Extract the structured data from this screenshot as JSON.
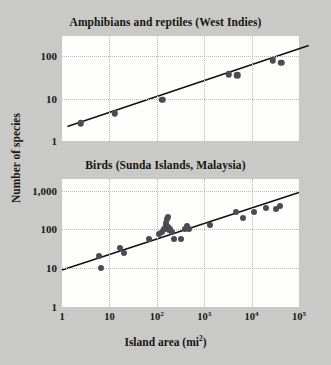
{
  "figure": {
    "background_color": "#c9c9c7",
    "plot_background_color": "#fdfdfb",
    "point_color": "#4b4b52",
    "line_color": "#121212",
    "grid_color": "#b9bcb0",
    "y_axis_label": "Number of species",
    "x_axis_label_prefix": "Island area (mi",
    "x_axis_label_sup": "2",
    "x_axis_label_suffix": ")"
  },
  "chart_data": [
    {
      "type": "scatter",
      "title": "Amphibians and reptiles (West Indies)",
      "xlabel": "Island area (mi2)",
      "ylabel": "Number of species",
      "xscale": "log",
      "yscale": "log",
      "xlim": [
        1,
        100000
      ],
      "ylim": [
        1,
        300
      ],
      "grid": true,
      "xticks": [],
      "xtick_labels": [],
      "yticks": [
        1,
        10,
        100
      ],
      "ytick_labels": [
        "1",
        "10",
        "100"
      ],
      "points": [
        {
          "x": 2.5,
          "y": 2.6
        },
        {
          "x": 13,
          "y": 4.5
        },
        {
          "x": 130,
          "y": 9.5
        },
        {
          "x": 3300,
          "y": 38
        },
        {
          "x": 5000,
          "y": 36
        },
        {
          "x": 28000,
          "y": 80
        },
        {
          "x": 42000,
          "y": 70
        }
      ],
      "trend": {
        "label": "best-fit line",
        "x_start": 1.3,
        "y_start": 2.2,
        "x_end": 160000,
        "y_end": 180
      }
    },
    {
      "type": "scatter",
      "title": "Birds (Sunda Islands, Malaysia)",
      "xlabel": "Island area (mi2)",
      "ylabel": "Number of species",
      "xscale": "log",
      "yscale": "log",
      "xlim": [
        1,
        100000
      ],
      "ylim": [
        1,
        2000
      ],
      "grid": true,
      "xticks": [
        1,
        10,
        100,
        1000,
        10000,
        100000
      ],
      "xtick_labels": [
        "1",
        "10",
        "10^2",
        "10^3",
        "10^4",
        "10^5"
      ],
      "yticks": [
        1,
        10,
        100,
        1000
      ],
      "ytick_labels": [
        "1",
        "10",
        "100",
        "1,000"
      ],
      "points": [
        {
          "x": 6,
          "y": 21
        },
        {
          "x": 6.5,
          "y": 10
        },
        {
          "x": 17,
          "y": 33
        },
        {
          "x": 20,
          "y": 24
        },
        {
          "x": 70,
          "y": 57
        },
        {
          "x": 110,
          "y": 75
        },
        {
          "x": 130,
          "y": 88
        },
        {
          "x": 140,
          "y": 100
        },
        {
          "x": 150,
          "y": 105
        },
        {
          "x": 155,
          "y": 130
        },
        {
          "x": 160,
          "y": 150
        },
        {
          "x": 165,
          "y": 190
        },
        {
          "x": 170,
          "y": 210
        },
        {
          "x": 175,
          "y": 118
        },
        {
          "x": 180,
          "y": 95
        },
        {
          "x": 190,
          "y": 105
        },
        {
          "x": 210,
          "y": 88
        },
        {
          "x": 230,
          "y": 57
        },
        {
          "x": 330,
          "y": 57
        },
        {
          "x": 400,
          "y": 105
        },
        {
          "x": 430,
          "y": 125
        },
        {
          "x": 470,
          "y": 100
        },
        {
          "x": 1300,
          "y": 128
        },
        {
          "x": 4800,
          "y": 290
        },
        {
          "x": 6500,
          "y": 195
        },
        {
          "x": 11000,
          "y": 280
        },
        {
          "x": 20000,
          "y": 360
        },
        {
          "x": 33000,
          "y": 330
        },
        {
          "x": 40000,
          "y": 400
        }
      ],
      "trend": {
        "label": "best-fit line",
        "x_start": 1,
        "y_start": 9,
        "x_end": 100000,
        "y_end": 900
      }
    }
  ]
}
